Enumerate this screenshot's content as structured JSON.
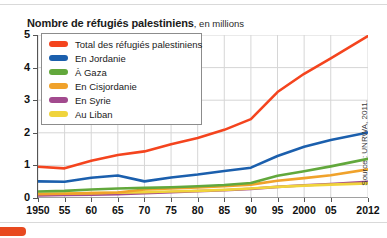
{
  "title": {
    "main": "Nombre de réfugiés palestiniens",
    "sub": ", en millions"
  },
  "source": "Source : UNRWA, 2011.",
  "legend": {
    "position": "top-left-inside"
  },
  "colors": {
    "total": "#f4441e",
    "jordanie": "#1b5fad",
    "gaza": "#62a83c",
    "cisjordanie": "#f0a22b",
    "syrie": "#a24a8e",
    "liban": "#f0d43c",
    "grid": "#d6d6d6",
    "axis": "#5a5a5a"
  },
  "chart_data": {
    "type": "line",
    "title": "Nombre de réfugiés palestiniens, en millions",
    "xlabel": "",
    "ylabel": "en millions",
    "ylim": [
      0,
      5
    ],
    "yticks": [
      0,
      1,
      2,
      3,
      4,
      5
    ],
    "ytick_labels": [
      "0",
      "1",
      "2",
      "3",
      "4",
      "5"
    ],
    "grid": true,
    "legend_position": "upper left",
    "x": [
      1950,
      1955,
      1960,
      1965,
      1970,
      1975,
      1980,
      1985,
      1990,
      1995,
      2000,
      2005,
      2012
    ],
    "xtick_labels": [
      "1950",
      "55",
      "60",
      "65",
      "70",
      "75",
      "80",
      "85",
      "90",
      "95",
      "2000",
      "05",
      "2012"
    ],
    "series": [
      {
        "name": "Total des réfugiés palestiniens",
        "color": "#f4441e",
        "values": [
          0.96,
          0.91,
          1.14,
          1.32,
          1.43,
          1.65,
          1.84,
          2.09,
          2.42,
          3.25,
          3.81,
          4.28,
          4.97
        ]
      },
      {
        "name": "En Jordanie",
        "color": "#1b5fad",
        "values": [
          0.51,
          0.5,
          0.62,
          0.69,
          0.51,
          0.63,
          0.72,
          0.83,
          0.93,
          1.29,
          1.57,
          1.78,
          2.01
        ]
      },
      {
        "name": "À Gaza",
        "color": "#62a83c",
        "values": [
          0.2,
          0.22,
          0.26,
          0.29,
          0.31,
          0.33,
          0.36,
          0.4,
          0.46,
          0.68,
          0.82,
          0.97,
          1.2
        ]
      },
      {
        "name": "En Cisjordanie",
        "color": "#f0a22b",
        "values": [
          0.12,
          0.13,
          0.15,
          0.17,
          0.26,
          0.29,
          0.32,
          0.36,
          0.41,
          0.53,
          0.61,
          0.7,
          0.88
        ]
      },
      {
        "name": "En Syrie",
        "color": "#a24a8e",
        "values": [
          0.08,
          0.09,
          0.1,
          0.12,
          0.15,
          0.18,
          0.21,
          0.24,
          0.28,
          0.34,
          0.39,
          0.43,
          0.5
        ]
      },
      {
        "name": "Au Liban",
        "color": "#f0d43c",
        "values": [
          0.13,
          0.14,
          0.15,
          0.16,
          0.18,
          0.2,
          0.22,
          0.25,
          0.29,
          0.34,
          0.38,
          0.41,
          0.45
        ]
      }
    ]
  }
}
